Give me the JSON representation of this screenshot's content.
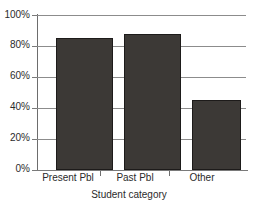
{
  "chart_data": {
    "type": "bar",
    "title": "",
    "xlabel": "Student category",
    "ylabel": "",
    "categories": [
      "Present Pbl",
      "Past Pbl",
      "Other"
    ],
    "values": [
      85,
      88,
      45
    ],
    "ylim": [
      0,
      100
    ],
    "yticks": [
      0,
      20,
      40,
      60,
      80,
      100
    ],
    "ytick_labels": [
      "0%",
      "20%",
      "40%",
      "60%",
      "80%",
      "100%"
    ],
    "grid": true,
    "legend": null,
    "bar_color": "#3c3936",
    "axis_color": "#7a7a7a",
    "gridline_color": "#8c8c8c",
    "text_color": "#2b2b2b"
  }
}
